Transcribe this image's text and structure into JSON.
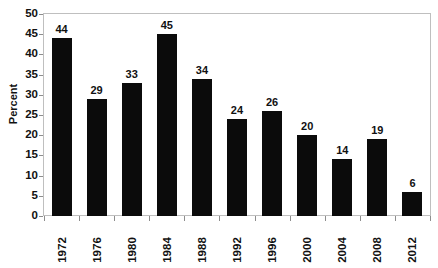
{
  "chart_data": {
    "type": "bar",
    "title": "",
    "subtitle": "",
    "xlabel": "",
    "ylabel": "Percent",
    "categories": [
      "1972",
      "1976",
      "1980",
      "1984",
      "1988",
      "1992",
      "1996",
      "2000",
      "2004",
      "2008",
      "2012"
    ],
    "values": [
      44,
      29,
      33,
      45,
      34,
      24,
      26,
      20,
      14,
      19,
      6
    ],
    "value_labels": [
      "44",
      "29",
      "33",
      "45",
      "34",
      "24",
      "26",
      "20",
      "14",
      "19",
      "6"
    ],
    "ylim": [
      0,
      50
    ],
    "ytick_step": 5,
    "ytick_labels": [
      "50",
      "45",
      "40",
      "35",
      "30",
      "25",
      "20",
      "15",
      "10",
      "5",
      "0"
    ],
    "ytick_values": [
      50,
      45,
      40,
      35,
      30,
      25,
      20,
      15,
      10,
      5,
      0
    ],
    "grid": false,
    "legend": false,
    "legend_position": "none",
    "annotations": [],
    "bar_color": "#0b0b0b",
    "frame_color": "#bfbfbf",
    "tick_color": "#8d8d8d",
    "text_color": "#111111",
    "background_color": "#ffffff",
    "xlabel_rotation": -90,
    "ylabel_rotation": -90,
    "data_labels_shown": true
  }
}
